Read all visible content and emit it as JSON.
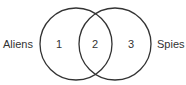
{
  "diagram": {
    "type": "venn",
    "sets": [
      {
        "name": "Aliens",
        "label": "Aliens"
      },
      {
        "name": "Spies",
        "label": "Spies"
      }
    ],
    "regions": [
      {
        "id": "1",
        "label": "1",
        "description": "Aliens only"
      },
      {
        "id": "2",
        "label": "2",
        "description": "Aliens and Spies"
      },
      {
        "id": "3",
        "label": "3",
        "description": "Spies only"
      }
    ],
    "colors": {
      "stroke": "#333333",
      "text": "#333333",
      "background": "#ffffff"
    }
  }
}
